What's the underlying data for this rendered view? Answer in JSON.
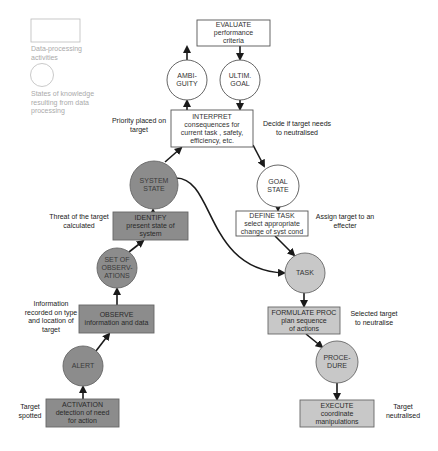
{
  "colors": {
    "dark_fill": "#8c8c8c",
    "light_fill": "#c8c8c8",
    "white_fill": "#ffffff",
    "stroke": "#555555",
    "arrow": "#1a1a1a",
    "legend": "#bbbbbb"
  },
  "legend": {
    "box_label": "Data-processing activities",
    "circle_label": "States of knowledge resulting from data processing"
  },
  "nodes": {
    "evaluate": {
      "title": "EVALUATE",
      "line1": "performance",
      "line2": "criteria"
    },
    "ambiguity": {
      "line1": "AMBI-",
      "line2": "GUITY"
    },
    "ultim_goal": {
      "line1": "ULTIM.",
      "line2": "GOAL"
    },
    "interpret": {
      "title": "INTERPRET",
      "line1": "consequences for",
      "line2": "current task , safety,",
      "line3": "efficiency, etc."
    },
    "system_state": {
      "line1": "SYSTEM",
      "line2": "STATE"
    },
    "goal_state": {
      "line1": "GOAL",
      "line2": "STATE"
    },
    "define_task": {
      "title": "DEFINE TASK",
      "line1": "select appropriate",
      "line2": "change of syst cond"
    },
    "identify": {
      "title": "IDENTIFY",
      "line1": "present state of",
      "line2": "system"
    },
    "set_of_observations": {
      "line1": "SET OF",
      "line2": "OBSERV-",
      "line3": "ATIONS"
    },
    "task": {
      "line1": "TASK"
    },
    "observe": {
      "title": "OBSERVE",
      "line1": "information and data"
    },
    "alert": {
      "line1": "ALERT"
    },
    "formulate_proc": {
      "title": "FORMULATE PROC",
      "line1": "plan sequence",
      "line2": "of actions"
    },
    "procedure": {
      "line1": "PROCE-",
      "line2": "DURE"
    },
    "activation": {
      "title": "ACTIVATION",
      "line1": "detection of need",
      "line2": "for action"
    },
    "execute": {
      "title": "EXECUTE",
      "line1": "coordinate",
      "line2": "manipulations"
    }
  },
  "annotations": {
    "priority": "Priority placed on target",
    "decide": "Decide if target needs to neutralised",
    "threat": "Threat of the target calculated",
    "assign": "Assign target to an effecter",
    "information": "Information recorded on type and location of target",
    "selected": "Selected target to neutralise",
    "spotted": "Target spotted",
    "neutralised": "Target neutralised"
  }
}
